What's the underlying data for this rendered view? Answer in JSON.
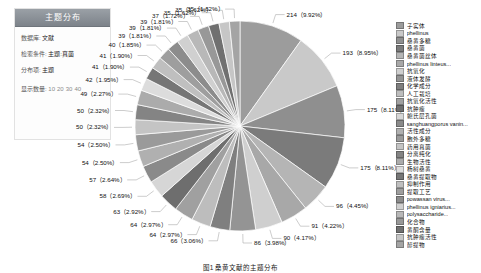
{
  "panel": {
    "title": "主题分布",
    "rows": [
      {
        "key": "数据库:",
        "value": "文献"
      },
      {
        "key": "检索条件:",
        "value": "主题:真菌"
      },
      {
        "key": "分布项:",
        "value": "主题"
      }
    ],
    "counts_label": "显示数量:",
    "counts": [
      "10",
      "20",
      "30",
      "40"
    ]
  },
  "caption": "图1  桑黄文献的主题分布",
  "chart_data": {
    "type": "pie",
    "title": "主题分布",
    "legend_position": "right",
    "total": 2158,
    "categories": [
      "子实体",
      "phellinus",
      "桑黄多糖",
      "桑黄菌",
      "桑黄菌丝体",
      "phellinus linteus...",
      "抗氧化",
      "液体发酵",
      "化学成分",
      "人工栽培",
      "抗氧化活性",
      "抗肿瘤",
      "鲍氏层孔菌",
      "sanghuangporus vanin...",
      "活性成分",
      "胞外多糖",
      "药用真菌",
      "分离纯化",
      "生物活性",
      "杨树桑黄",
      "桑黄提取物",
      "抑制作用",
      "提取工艺",
      "powassan virus...",
      "phellinus igniarius...",
      "polysaccharide...",
      "化合物",
      "黄酮含量",
      "抗肿瘤活性",
      "醇提物"
    ],
    "values": [
      214,
      193,
      175,
      175,
      96,
      91,
      90,
      86,
      66,
      64,
      64,
      63,
      58,
      57,
      54,
      54,
      50,
      50,
      49,
      42,
      41,
      41,
      40,
      39,
      39,
      39,
      37,
      35,
      35,
      35
    ],
    "percents": [
      "9.92%",
      "8.95%",
      "8.11%",
      "8.11%",
      "4.45%",
      "4.22%",
      "4.17%",
      "3.98%",
      "3.06%",
      "2.97%",
      "2.97%",
      "2.92%",
      "2.69%",
      "2.64%",
      "2.50%",
      "2.50%",
      "2.32%",
      "2.32%",
      "2.27%",
      "1.95%",
      "1.90%",
      "1.90%",
      "1.85%",
      "1.81%",
      "1.81%",
      "1.81%",
      "1.72%",
      "1.62%",
      "1.62%",
      "1.62%"
    ],
    "labels": [
      "214（9.92%）",
      "193（8.95%）",
      "175（8.11%）",
      "175（8.11%）",
      "96（4.45%）",
      "91（4.22%）",
      "90（4.17%）",
      "86（3.98%）",
      "66（3.06%）",
      "64（2.97%）",
      "64（2.97%）",
      "63（2.92%）",
      "58（2.69%）",
      "57（2.64%）",
      "54（2.50%）",
      "54（2.50%）",
      "50（2.32%）",
      "50（2.32%）",
      "49（2.27%）",
      "42（1.95%）",
      "41（1.90%）",
      "41（1.90%）",
      "40（1.85%）",
      "39（1.81%）",
      "39（1.81%）",
      "39（1.81%）",
      "37（1.72%）",
      "35（1.62%）",
      "35（1.62%）",
      "35（1.62%）"
    ],
    "colors": [
      "#9c9c9c",
      "#c9c9c9",
      "#8f8f8f",
      "#7b7b7b",
      "#b5b5b5",
      "#a8a8a8",
      "#cfcfcf",
      "#949494",
      "#7f7f7f",
      "#bdbdbd",
      "#a0a0a0",
      "#6e6e6e",
      "#d6d6d6",
      "#8a8a8a",
      "#b0b0b0",
      "#9a9a9a",
      "#c4c4c4",
      "#848484",
      "#ababab",
      "#dcdcdc",
      "#767676",
      "#bfbfbf",
      "#9e9e9e",
      "#8c8c8c",
      "#d0d0d0",
      "#b8b8b8",
      "#989898",
      "#707070",
      "#c6c6c6",
      "#a4a4a4"
    ]
  }
}
